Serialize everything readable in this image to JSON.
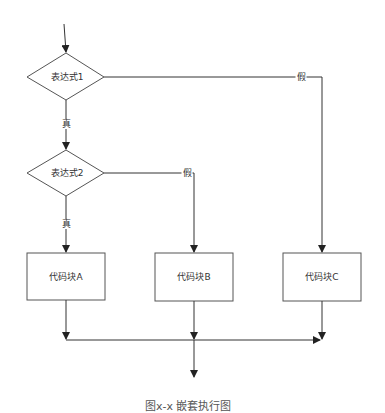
{
  "diagram": {
    "type": "flowchart",
    "line_color": "#333333",
    "node_stroke": "#555555",
    "node_fill": "#ffffff",
    "nodes": [
      {
        "id": "cond1",
        "shape": "diamond",
        "label": "表达式1"
      },
      {
        "id": "cond2",
        "shape": "diamond",
        "label": "表达式2"
      },
      {
        "id": "blockA",
        "shape": "rect",
        "label": "代码块A"
      },
      {
        "id": "blockB",
        "shape": "rect",
        "label": "代码块B"
      },
      {
        "id": "blockC",
        "shape": "rect",
        "label": "代码块C"
      }
    ],
    "edges": [
      {
        "from": "start",
        "to": "cond1",
        "label": ""
      },
      {
        "from": "cond1",
        "to": "cond2",
        "label": "真"
      },
      {
        "from": "cond1",
        "to": "blockC",
        "label": "假"
      },
      {
        "from": "cond2",
        "to": "blockA",
        "label": "真"
      },
      {
        "from": "cond2",
        "to": "blockB",
        "label": "假"
      },
      {
        "from": "blockA",
        "to": "merge",
        "label": ""
      },
      {
        "from": "blockB",
        "to": "merge",
        "label": ""
      },
      {
        "from": "blockC",
        "to": "merge",
        "label": ""
      },
      {
        "from": "merge",
        "to": "end",
        "label": ""
      }
    ],
    "edge_labels": {
      "cond1_true": "真",
      "cond1_false": "假",
      "cond2_true": "真",
      "cond2_false": "假"
    },
    "caption": "图x-x 嵌套执行图"
  }
}
